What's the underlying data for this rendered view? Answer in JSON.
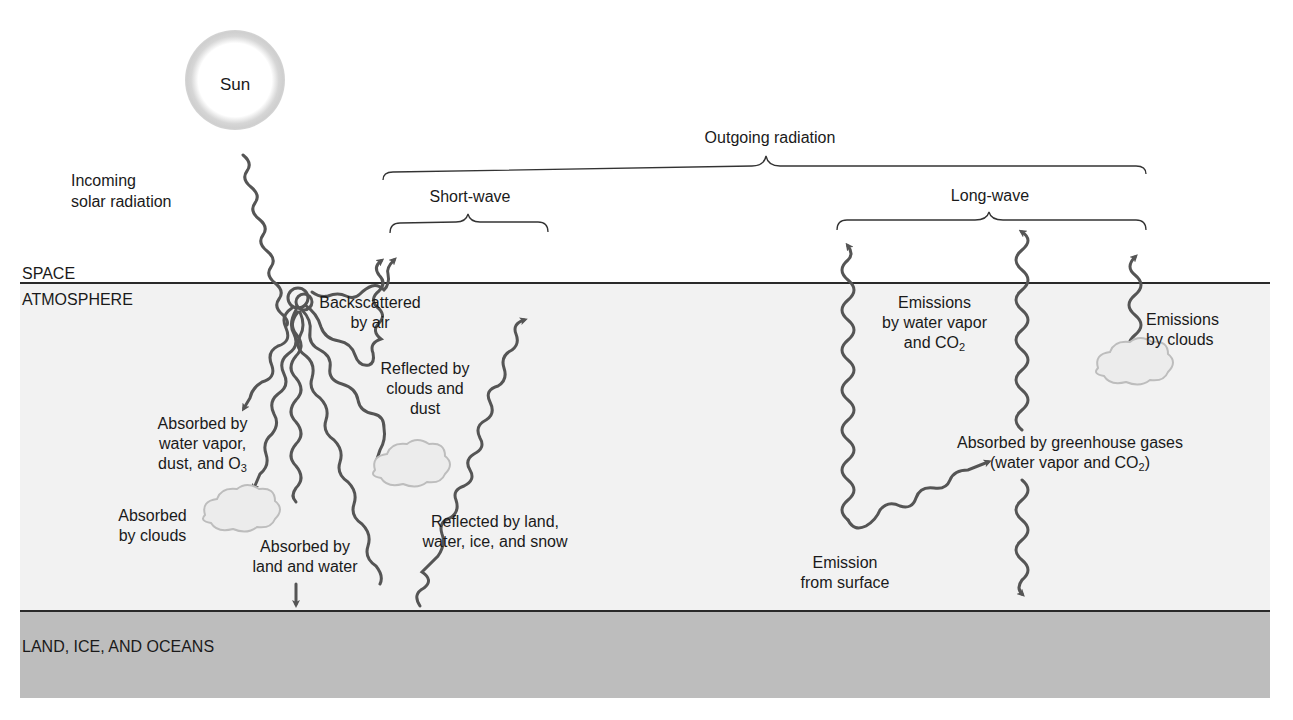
{
  "diagram": {
    "layers": {
      "space": "SPACE",
      "atmosphere": "ATMOSPHERE",
      "surface": "LAND, ICE, AND OCEANS"
    },
    "sun_label": "Sun",
    "incoming": {
      "line1": "Incoming",
      "line2": "solar radiation"
    },
    "outgoing": {
      "title": "Outgoing radiation",
      "short_wave": "Short-wave",
      "long_wave": "Long-wave"
    },
    "short_wave_paths": {
      "backscattered": {
        "line1": "Backscattered",
        "line2": "by air"
      },
      "reflected_clouds": {
        "line1": "Reflected by",
        "line2": "clouds and",
        "line3": "dust"
      },
      "reflected_land": {
        "line1": "Reflected by land,",
        "line2": "water, ice, and snow"
      },
      "absorbed_vapor": {
        "line1": "Absorbed by",
        "line2": "water vapor,",
        "line3": "dust, and O",
        "line3_sub": "3"
      },
      "absorbed_clouds": {
        "line1": "Absorbed",
        "line2": "by clouds"
      },
      "absorbed_land": {
        "line1": "Absorbed by",
        "line2": "land and water"
      }
    },
    "long_wave_paths": {
      "emissions_vapor": {
        "line1": "Emissions",
        "line2": "by water vapor",
        "line3": "and CO",
        "line3_sub": "2"
      },
      "emissions_clouds": {
        "line1": "Emissions",
        "line2": "by clouds"
      },
      "absorbed_ghg": {
        "line1": "Absorbed by greenhouse gases",
        "line2": "(water vapor and CO",
        "line2_sub": "2",
        "line2_end": ")"
      },
      "emission_surface": {
        "line1": "Emission",
        "line2": "from surface"
      }
    },
    "colors": {
      "atmosphere": "#f2f2f2",
      "surface": "#bdbdbd",
      "arrow": "#555555",
      "line": "#2a2a2a"
    }
  }
}
